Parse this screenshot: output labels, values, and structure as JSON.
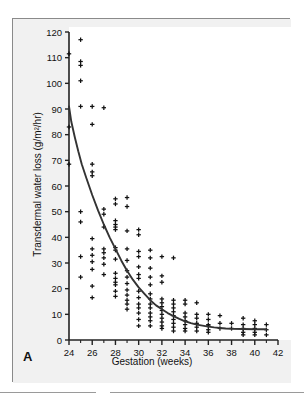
{
  "figure": {
    "panel_label": "A",
    "background_color": "#f1f1f1",
    "frame_color": "#8a8a8a",
    "marker_color": "#111111",
    "curve_color": "#333333"
  },
  "chart_data": {
    "type": "scatter",
    "title": "",
    "subtitle": "",
    "xlabel": "Gestation (weeks)",
    "ylabel": "Transdermal water loss (g/m2/hr)",
    "ylabel_display": "Transdermal water loss (g/m²/hr)",
    "xlim": [
      24,
      42
    ],
    "ylim": [
      0,
      120
    ],
    "xticks": [
      24,
      26,
      28,
      30,
      32,
      34,
      36,
      38,
      40,
      42
    ],
    "xtick_labels": [
      "24",
      "26",
      "28",
      "30",
      "32",
      "34",
      "36",
      "38",
      "40",
      "42"
    ],
    "x_minor_ticks": [
      25,
      27,
      29,
      31,
      33,
      35,
      37,
      39,
      41
    ],
    "yticks": [
      0,
      10,
      20,
      30,
      40,
      50,
      60,
      70,
      80,
      90,
      100,
      110,
      120
    ],
    "ytick_labels": [
      "0",
      "10",
      "20",
      "30",
      "40",
      "50",
      "60",
      "70",
      "80",
      "90",
      "100",
      "110",
      "120"
    ],
    "grid": false,
    "legend": null,
    "marker": "plus",
    "series": [
      {
        "name": "Transdermal water loss measurements",
        "marker": "plus",
        "points": [
          [
            24,
            111.5
          ],
          [
            24,
            83.0
          ],
          [
            24,
            68.5
          ],
          [
            25,
            117.0
          ],
          [
            25,
            108.5
          ],
          [
            25,
            107.0
          ],
          [
            25,
            101.0
          ],
          [
            25,
            91.0
          ],
          [
            25,
            50.0
          ],
          [
            25,
            46.0
          ],
          [
            25,
            32.5
          ],
          [
            25,
            24.5
          ],
          [
            26,
            91.0
          ],
          [
            26,
            84.0
          ],
          [
            26,
            68.5
          ],
          [
            26,
            65.5
          ],
          [
            26,
            64.0
          ],
          [
            26,
            39.5
          ],
          [
            26,
            35.5
          ],
          [
            26,
            33.0
          ],
          [
            26,
            30.5
          ],
          [
            26,
            27.5
          ],
          [
            26,
            21.0
          ],
          [
            26,
            16.5
          ],
          [
            27,
            90.5
          ],
          [
            27,
            51.0
          ],
          [
            27,
            49.0
          ],
          [
            27,
            44.0
          ],
          [
            27,
            35.5
          ],
          [
            27,
            34.0
          ],
          [
            27,
            32.0
          ],
          [
            27,
            29.5
          ],
          [
            27,
            25.5
          ],
          [
            28,
            55.0
          ],
          [
            28,
            53.0
          ],
          [
            28,
            46.5
          ],
          [
            28,
            45.0
          ],
          [
            28,
            44.0
          ],
          [
            28,
            43.0
          ],
          [
            28,
            36.0
          ],
          [
            28,
            35.0
          ],
          [
            28,
            31.5
          ],
          [
            28,
            26.0
          ],
          [
            28,
            24.0
          ],
          [
            28,
            22.5
          ],
          [
            28,
            21.5
          ],
          [
            28,
            19.0
          ],
          [
            28,
            17.0
          ],
          [
            29,
            55.5
          ],
          [
            29,
            52.0
          ],
          [
            29,
            42.5
          ],
          [
            29,
            35.5
          ],
          [
            29,
            31.0
          ],
          [
            29,
            27.0
          ],
          [
            29,
            24.5
          ],
          [
            29,
            22.0
          ],
          [
            29,
            19.5
          ],
          [
            29,
            17.5
          ],
          [
            29,
            15.5
          ],
          [
            29,
            14.0
          ],
          [
            29,
            12.0
          ],
          [
            30,
            43.0
          ],
          [
            30,
            41.0
          ],
          [
            30,
            34.5
          ],
          [
            30,
            32.5
          ],
          [
            30,
            28.5
          ],
          [
            30,
            25.5
          ],
          [
            30,
            24.0
          ],
          [
            30,
            19.0
          ],
          [
            30,
            16.5
          ],
          [
            30,
            14.0
          ],
          [
            30,
            12.5
          ],
          [
            30,
            10.5
          ],
          [
            30,
            8.0
          ],
          [
            30,
            5.5
          ],
          [
            31,
            35.0
          ],
          [
            31,
            32.0
          ],
          [
            31,
            28.0
          ],
          [
            31,
            24.5
          ],
          [
            31,
            21.5
          ],
          [
            31,
            18.0
          ],
          [
            31,
            16.0
          ],
          [
            31,
            14.0
          ],
          [
            31,
            12.5
          ],
          [
            31,
            10.5
          ],
          [
            31,
            9.0
          ],
          [
            31,
            7.5
          ],
          [
            31,
            5.5
          ],
          [
            32,
            32.5
          ],
          [
            32,
            25.0
          ],
          [
            32,
            22.5
          ],
          [
            32,
            16.0
          ],
          [
            32,
            14.5
          ],
          [
            32,
            13.0
          ],
          [
            32,
            11.5
          ],
          [
            32,
            10.0
          ],
          [
            32,
            8.5
          ],
          [
            32,
            7.0
          ],
          [
            32,
            5.5
          ],
          [
            32,
            4.5
          ],
          [
            33,
            32.0
          ],
          [
            33,
            15.5
          ],
          [
            33,
            14.0
          ],
          [
            33,
            12.5
          ],
          [
            33,
            11.0
          ],
          [
            33,
            9.5
          ],
          [
            33,
            8.0
          ],
          [
            33,
            6.5
          ],
          [
            33,
            5.0
          ],
          [
            33,
            3.5
          ],
          [
            34,
            15.5
          ],
          [
            34,
            14.0
          ],
          [
            34,
            10.5
          ],
          [
            34,
            9.0
          ],
          [
            34,
            7.5
          ],
          [
            34,
            6.0
          ],
          [
            34,
            4.5
          ],
          [
            34,
            3.5
          ],
          [
            35,
            14.5
          ],
          [
            35,
            10.0
          ],
          [
            35,
            8.5
          ],
          [
            35,
            6.5
          ],
          [
            35,
            5.0
          ],
          [
            35,
            3.5
          ],
          [
            36,
            10.0
          ],
          [
            36,
            8.0
          ],
          [
            36,
            6.0
          ],
          [
            36,
            5.5
          ],
          [
            36,
            4.0
          ],
          [
            36,
            3.0
          ],
          [
            37,
            9.5
          ],
          [
            37,
            6.5
          ],
          [
            37,
            4.5
          ],
          [
            38,
            6.5
          ],
          [
            38,
            4.5
          ],
          [
            39,
            8.5
          ],
          [
            39,
            6.0
          ],
          [
            39,
            4.5
          ],
          [
            39,
            3.0
          ],
          [
            39,
            2.0
          ],
          [
            40,
            7.5
          ],
          [
            40,
            6.0
          ],
          [
            40,
            4.5
          ],
          [
            40,
            3.0
          ],
          [
            40,
            2.0
          ],
          [
            41,
            6.0
          ],
          [
            41,
            4.0
          ],
          [
            41,
            2.0
          ]
        ]
      }
    ],
    "fit_curve": {
      "name": "fitted regression curve",
      "description": "exponential decay fit of transdermal water loss against gestation",
      "points": [
        [
          24.0,
          91.0
        ],
        [
          24.2,
          85.0
        ],
        [
          24.5,
          79.0
        ],
        [
          24.8,
          73.5
        ],
        [
          25.1,
          68.5
        ],
        [
          25.5,
          63.0
        ],
        [
          26.0,
          56.5
        ],
        [
          26.5,
          50.5
        ],
        [
          27.0,
          45.0
        ],
        [
          27.5,
          40.0
        ],
        [
          28.0,
          35.5
        ],
        [
          28.5,
          31.0
        ],
        [
          29.0,
          27.0
        ],
        [
          29.5,
          23.5
        ],
        [
          30.0,
          20.5
        ],
        [
          30.5,
          18.0
        ],
        [
          31.0,
          15.5
        ],
        [
          31.5,
          13.5
        ],
        [
          32.0,
          12.0
        ],
        [
          32.5,
          10.5
        ],
        [
          33.0,
          9.3
        ],
        [
          33.5,
          8.2
        ],
        [
          34.0,
          7.3
        ],
        [
          34.5,
          6.6
        ],
        [
          35.0,
          6.0
        ],
        [
          35.5,
          5.6
        ],
        [
          36.0,
          5.2
        ],
        [
          36.5,
          4.9
        ],
        [
          37.0,
          4.7
        ],
        [
          37.5,
          4.5
        ],
        [
          38.0,
          4.4
        ],
        [
          39.0,
          4.3
        ],
        [
          40.0,
          4.2
        ],
        [
          41.0,
          4.2
        ]
      ]
    }
  }
}
